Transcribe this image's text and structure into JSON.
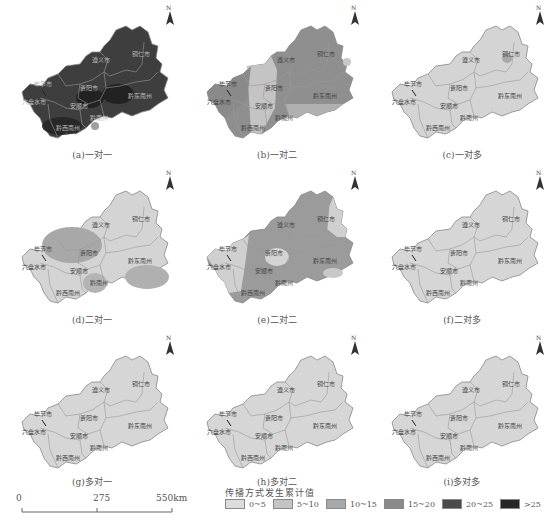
{
  "figure": {
    "panels": [
      {
        "id": "a",
        "caption": "(a)一对一",
        "base_class": "20~25",
        "base_color": "#3e3e3e"
      },
      {
        "id": "b",
        "caption": "(b)一对二",
        "base_class": "10~15",
        "base_color": "#8f8f8f"
      },
      {
        "id": "c",
        "caption": "(c)一对多",
        "base_class": "0~5",
        "base_color": "#d4d4d4"
      },
      {
        "id": "d",
        "caption": "(d)二对一",
        "base_class": "0~5",
        "base_color": "#d4d4d4"
      },
      {
        "id": "e",
        "caption": "(e)二对二",
        "base_class": "10~15",
        "base_color": "#9b9b9b"
      },
      {
        "id": "f",
        "caption": "(f)二对多",
        "base_class": "0~5",
        "base_color": "#d6d6d6"
      },
      {
        "id": "g",
        "caption": "(g)多对一",
        "base_class": "0~5",
        "base_color": "#d6d6d6"
      },
      {
        "id": "h",
        "caption": "(h)多对二",
        "base_class": "0~5",
        "base_color": "#d6d6d6"
      },
      {
        "id": "i",
        "caption": "(i)多对多",
        "base_class": "0~5",
        "base_color": "#d6d6d6"
      }
    ],
    "region_labels": {
      "zunyi": "遵义市",
      "tongren": "铜仁市",
      "bijie": "毕节市",
      "guiyang": "贵阳市",
      "qiandongnan": "黔东南州",
      "liupanshui": "六盘水市",
      "anshun": "安顺市",
      "qiannan": "黔南州",
      "qianxinan": "黔西南州"
    },
    "north_label": "N",
    "scale_bar": {
      "ticks": [
        "0",
        "275",
        "550km"
      ]
    },
    "legend": {
      "title": "传播方式发生累计值",
      "items": [
        {
          "label": "0~5",
          "color": "#dcdcdc"
        },
        {
          "label": "5~10",
          "color": "#c4c4c4"
        },
        {
          "label": "10~15",
          "color": "#a8a8a8"
        },
        {
          "label": "15~20",
          "color": "#8a8a8a"
        },
        {
          "label": "20~25",
          "color": "#4a4a4a"
        },
        {
          "label": ">25",
          "color": "#262626"
        }
      ]
    }
  }
}
